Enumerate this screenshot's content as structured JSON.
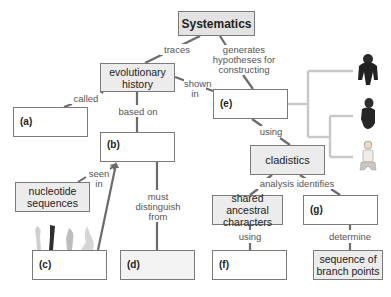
{
  "diagram": {
    "type": "concept-map",
    "nodes": {
      "systematics": "Systematics",
      "evolutionary_history": "evolutionary history",
      "a": "(a)",
      "b": "(b)",
      "nucleotide_sequences": "nucleotide sequences",
      "c": "(c)",
      "d": "(d)",
      "e": "(e)",
      "cladistics": "cladistics",
      "shared_ancestral": "shared ancestral characters",
      "g": "(g)",
      "f": "(f)",
      "branch_points": "sequence of branch points"
    },
    "links": {
      "traces": "traces",
      "generates": "generates hypotheses for constructing",
      "called": "called",
      "based_on": "based on",
      "shown_in": "shown in",
      "seen_in": "seen in",
      "must_distinguish": "must distinguish from",
      "using_e": "using",
      "analysis_identifies": "analysis identifies",
      "using_f": "using",
      "determine": "determine"
    },
    "illustrations": {
      "tree_tips": [
        "gorilla-image",
        "chimpanzee-image",
        "human-image"
      ],
      "limbs": [
        "limb-bone-1",
        "limb-bone-2",
        "limb-bone-3",
        "limb-bone-4"
      ]
    }
  }
}
